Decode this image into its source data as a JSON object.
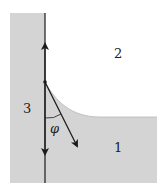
{
  "diagram": {
    "labels": {
      "region_1": "1",
      "region_2": "2",
      "region_3": "3",
      "angle": "φ"
    },
    "colors": {
      "fill": "#d4d4d4",
      "line": "#1a1a1a",
      "background": "#ffffff"
    }
  }
}
